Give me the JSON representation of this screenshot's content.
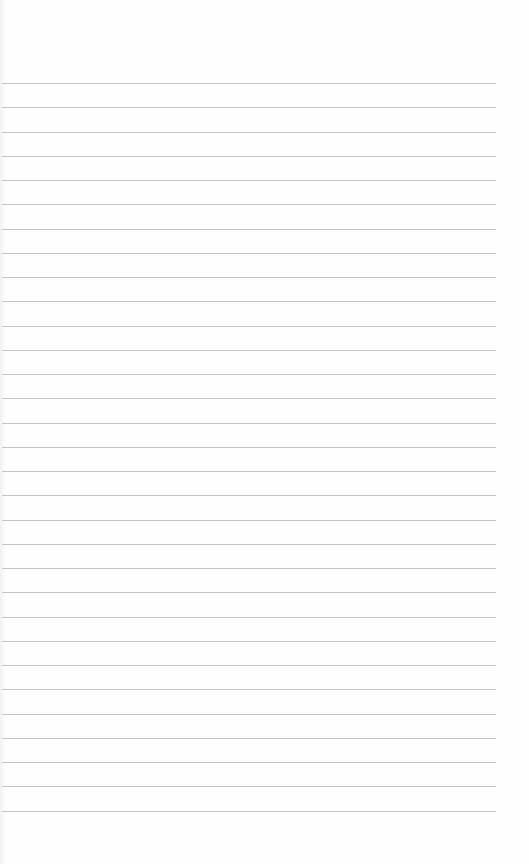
{
  "paper": {
    "type": "lined-paper",
    "background_color": "#fefefe",
    "line_color": "#c4c4c4",
    "line_count": 31,
    "first_line_y": 83,
    "line_spacing": 24.25,
    "line_left": 2,
    "line_right": 496
  }
}
